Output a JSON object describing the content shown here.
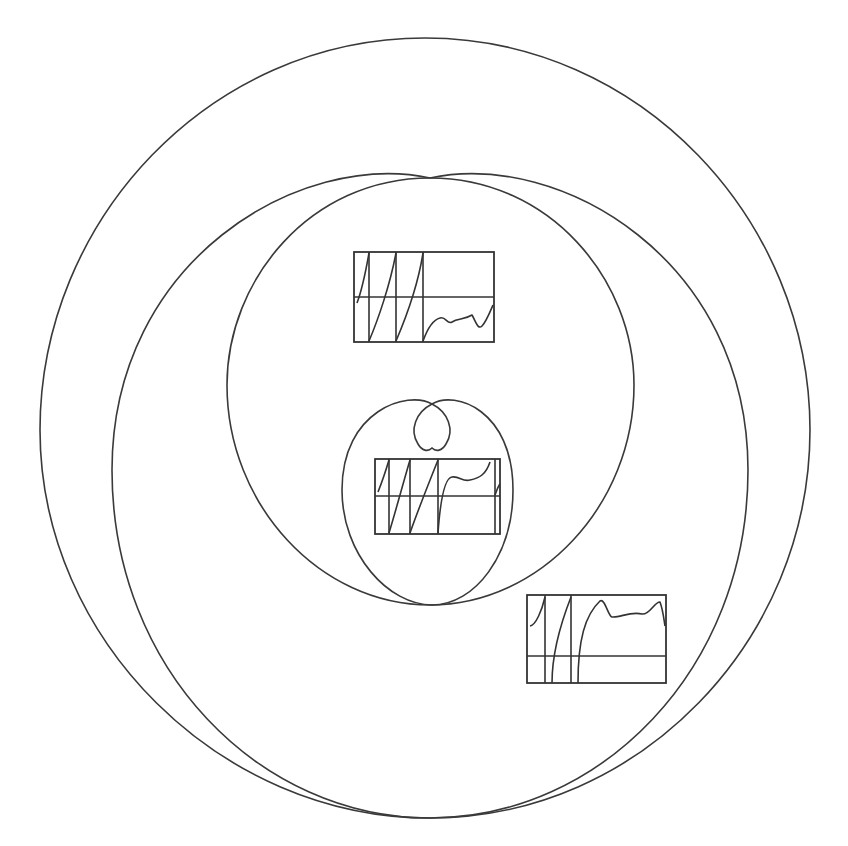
{
  "figure": {
    "stroke_color": "#3a3a3a",
    "background": "#ffffff",
    "curves": [
      {
        "name": "outer-curve",
        "left": 40,
        "right": 810,
        "top": 38,
        "bottom": 818
      },
      {
        "name": "second-curve",
        "left": 112,
        "right": 748,
        "top": 178,
        "bottom": 818
      },
      {
        "name": "inner-loop-curve",
        "left": 227,
        "right": 634,
        "top": 178,
        "bottom": 605
      },
      {
        "name": "small-curve",
        "left": 342,
        "right": 513,
        "top": 400,
        "bottom": 605
      },
      {
        "name": "small-inner-loop",
        "left": 414,
        "right": 450,
        "top": 400,
        "bottom": 450
      }
    ],
    "insets": [
      {
        "name": "inset-plot-1",
        "x": 354,
        "y": 252,
        "w": 140,
        "h": 90,
        "midline": 297
      },
      {
        "name": "inset-plot-2",
        "x": 375,
        "y": 459,
        "w": 125,
        "h": 75,
        "midline": 496
      },
      {
        "name": "inset-plot-3",
        "x": 527,
        "y": 595,
        "w": 139,
        "h": 88,
        "midline": 656
      }
    ]
  }
}
